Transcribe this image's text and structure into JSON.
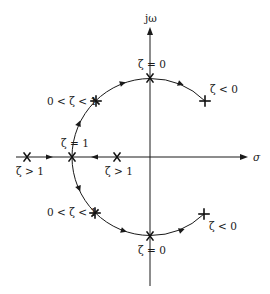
{
  "diagram": {
    "type": "root-locus / damping-ratio pole trajectory",
    "axes": {
      "imag_label": "jω",
      "real_label": "σ"
    },
    "labels": {
      "top_zeta0": "ζ = 0",
      "bottom_zeta0": "ζ = 0",
      "upper_left_underdamped": "0 < ζ < 1",
      "lower_left_underdamped": "0 < ζ < 1",
      "zeta1": "ζ = 1",
      "left_overdamped": "ζ > 1",
      "right_overdamped": "ζ > 1",
      "upper_right_negative": "ζ < 0",
      "lower_right_negative": "ζ < 0"
    },
    "poles": [
      {
        "name": "pole-zeta-overdamped-far",
        "x": 27,
        "y": 157,
        "marker": "x"
      },
      {
        "name": "pole-zeta-critical",
        "x": 72,
        "y": 157,
        "marker": "x"
      },
      {
        "name": "pole-zeta-overdamped-near",
        "x": 117,
        "y": 157,
        "marker": "x"
      },
      {
        "name": "pole-upper-underdamped",
        "x": 96,
        "y": 101,
        "marker": "star"
      },
      {
        "name": "pole-upper-undamped",
        "x": 150,
        "y": 78,
        "marker": "x"
      },
      {
        "name": "pole-upper-negative",
        "x": 205,
        "y": 101,
        "marker": "plus"
      },
      {
        "name": "pole-lower-underdamped",
        "x": 95,
        "y": 213,
        "marker": "star"
      },
      {
        "name": "pole-lower-undamped",
        "x": 150,
        "y": 236,
        "marker": "x"
      },
      {
        "name": "pole-lower-negative",
        "x": 204,
        "y": 214,
        "marker": "plus"
      }
    ],
    "colors": {
      "ink": "#1a1a1a",
      "background": "#ffffff"
    }
  }
}
